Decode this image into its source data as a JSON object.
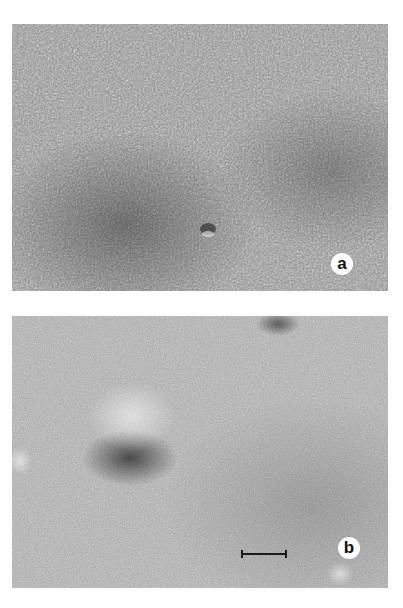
{
  "figure": {
    "panels": [
      {
        "id": "a",
        "label": "a",
        "description": "freeze-fracture replica surface densely covered with particles",
        "tone": "#8a8a8a"
      },
      {
        "id": "b",
        "label": "b",
        "description": "smoother fracture surface with sparse particles and a dome-shaped bulge",
        "tone": "#a2a2a2"
      }
    ],
    "scale_bar": {
      "present": true,
      "panel": "b"
    }
  }
}
